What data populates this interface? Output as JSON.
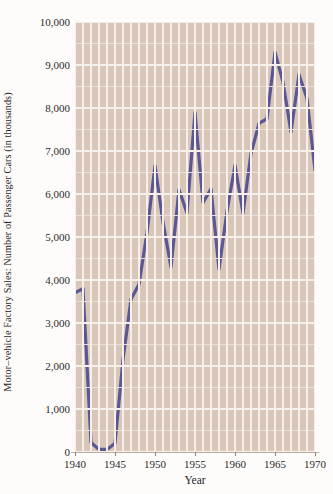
{
  "chart_data": {
    "type": "line",
    "title": "",
    "xlabel": "Year",
    "ylabel": "Motor–vehicle Factory Sales: Number of Passenger Cars (in thousands)",
    "xlim": [
      1940,
      1970
    ],
    "ylim": [
      0,
      10000
    ],
    "grid": true,
    "legend": false,
    "line_color": "#5a5794",
    "plot_background": "#d9c6b8",
    "gridline_color": "#f6f0ea",
    "x_ticks": [
      "1940",
      "1945",
      "1950",
      "1955",
      "1960",
      "1965",
      "1970"
    ],
    "x_tick_values": [
      1940,
      1945,
      1950,
      1955,
      1960,
      1965,
      1970
    ],
    "y_ticks": [
      "0",
      "1,000",
      "2,000",
      "3,000",
      "4,000",
      "5,000",
      "6,000",
      "7,000",
      "8,000",
      "9,000",
      "10,000"
    ],
    "y_tick_values": [
      0,
      1000,
      2000,
      3000,
      4000,
      5000,
      6000,
      7000,
      8000,
      9000,
      10000
    ],
    "x": [
      1940,
      1941,
      1942,
      1943,
      1944,
      1945,
      1946,
      1947,
      1948,
      1949,
      1950,
      1951,
      1952,
      1953,
      1954,
      1955,
      1956,
      1957,
      1958,
      1959,
      1960,
      1961,
      1962,
      1963,
      1964,
      1965,
      1966,
      1967,
      1968,
      1969,
      1970
    ],
    "values": [
      3700,
      3800,
      220,
      60,
      60,
      200,
      2150,
      3550,
      3900,
      5100,
      6660,
      5340,
      4300,
      6100,
      5560,
      7900,
      5800,
      6120,
      4250,
      5600,
      6670,
      5550,
      6940,
      7640,
      7750,
      9300,
      8600,
      7440,
      8780,
      8220,
      6550
    ]
  },
  "axis": {
    "y_title": "Motor–vehicle Factory Sales: Number of Passenger Cars (in thousands)",
    "x_title": "Year"
  }
}
